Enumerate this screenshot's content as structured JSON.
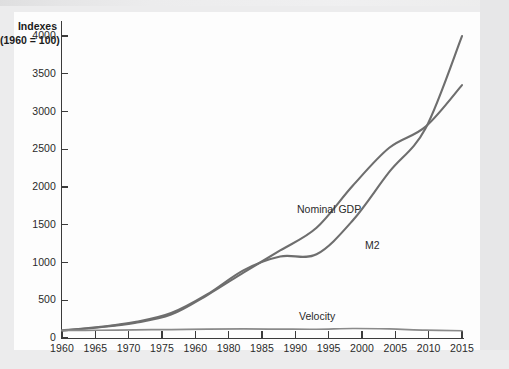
{
  "chart_data": {
    "type": "line",
    "title": "",
    "ylabel_line1": "Indexes",
    "ylabel_line2": "(1960 = 100)",
    "xlabel": "",
    "grid": false,
    "legend_position": "inline-annotations",
    "ylim": [
      0,
      4200
    ],
    "yticks": [
      0,
      500,
      1000,
      1500,
      2000,
      2500,
      3000,
      3500,
      4000
    ],
    "ytick_labels": [
      "0",
      "500",
      "1000",
      "1500",
      "2000",
      "2500",
      "3000",
      "3500",
      "4000"
    ],
    "xlim": [
      1960,
      2015
    ],
    "xticks": [
      1960,
      1965,
      1970,
      1975,
      1980,
      1985,
      1990,
      1995,
      2000,
      2005,
      2010,
      2015
    ],
    "xtick_labels": [
      "1960",
      "1965",
      "1970",
      "1975",
      "1960",
      "1980",
      "1985",
      "1990",
      "1995",
      "2000",
      "2005",
      "2010",
      "2015"
    ],
    "x": [
      1960,
      1965,
      1970,
      1975,
      1980,
      1985,
      1990,
      1995,
      2000,
      2005,
      2010,
      2015
    ],
    "series": [
      {
        "name": "Nominal GDP",
        "color": "#6e6e6e",
        "values": [
          100,
          140,
          200,
          310,
          570,
          870,
          1160,
          1460,
          2020,
          2520,
          2800,
          3350
        ]
      },
      {
        "name": "M2",
        "color": "#6e6e6e",
        "values": [
          100,
          145,
          210,
          330,
          580,
          900,
          1080,
          1110,
          1560,
          2200,
          2780,
          4000
        ]
      },
      {
        "name": "Velocity",
        "color": "#8a8a8a",
        "values": [
          100,
          103,
          108,
          112,
          118,
          120,
          118,
          116,
          126,
          120,
          104,
          96
        ]
      }
    ],
    "annotations": [
      {
        "text": "Nominal GDP",
        "x": 1994,
        "y": 1850
      },
      {
        "text": "M2",
        "x": 2003,
        "y": 1250
      },
      {
        "text": "Velocity",
        "x": 1993,
        "y": 270
      }
    ]
  },
  "colors": {
    "axis": "#3b3b3b",
    "text": "#2a2a2a",
    "line": "#6e6e6e",
    "page": "#fdfdfd",
    "background": "#ececed"
  }
}
